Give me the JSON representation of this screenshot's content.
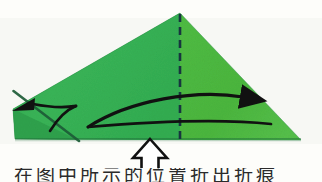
{
  "figure": {
    "background_color": "#fdfdfa",
    "paper": {
      "left_panel_color": "#37b055",
      "right_panel_color": "#4cb93f",
      "left_panel_shade_color": "#2f9f4b",
      "edge_shadow_color": "#1f6b38",
      "apex": {
        "x": 180,
        "y": 13
      },
      "left_vertex": {
        "x": 13,
        "y": 109
      },
      "right_vertex": {
        "x": 301,
        "y": 140
      },
      "bottom_left": {
        "x": 15,
        "y": 139
      }
    },
    "fold_line": {
      "name": "valley-fold-dashed-line",
      "style": "dashed",
      "color": "#16343f",
      "from": {
        "x": 180,
        "y": 13
      },
      "to": {
        "x": 180,
        "y": 140
      },
      "dash_pattern": "7 5",
      "width_px": 2.4
    },
    "crease_line": {
      "name": "existing-crease-line",
      "color": "#1e5f39",
      "from": {
        "x": 14,
        "y": 92
      },
      "to": {
        "x": 78,
        "y": 140
      }
    },
    "fold_arrow": {
      "name": "fold-right-curved-arrow",
      "color": "#111111",
      "direction": "right",
      "tip": {
        "x": 254,
        "y": 100
      },
      "start": {
        "x": 88,
        "y": 127
      }
    },
    "small_arrow": {
      "name": "unfold-left-curved-arrow",
      "color": "#111111",
      "direction": "left",
      "tip": {
        "x": 12,
        "y": 111
      }
    },
    "push_arrow": {
      "name": "push-up-hollow-arrow",
      "fill": "#ffffff",
      "stroke": "#111111",
      "direction": "up",
      "tip": {
        "x": 150,
        "y": 140
      },
      "base_y": 172
    }
  },
  "caption": {
    "text": "在图中所示的位置折出折痕"
  }
}
